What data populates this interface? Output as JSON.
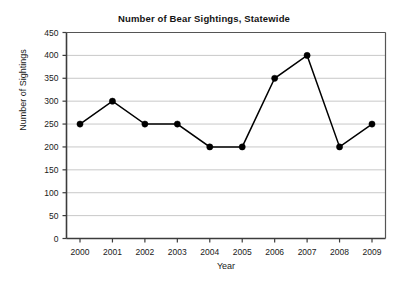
{
  "chart_data": {
    "type": "line",
    "title": "Number of Bear Sightings, Statewide",
    "xlabel": "Year",
    "ylabel": "Number of Sightings",
    "categories": [
      "2000",
      "2001",
      "2002",
      "2003",
      "2004",
      "2005",
      "2006",
      "2007",
      "2008",
      "2009"
    ],
    "values": [
      250,
      300,
      250,
      250,
      200,
      200,
      350,
      400,
      200,
      250
    ],
    "series": [
      {
        "name": "Bear Sightings",
        "values": [
          250,
          300,
          250,
          250,
          200,
          200,
          350,
          400,
          200,
          250
        ]
      }
    ],
    "ylim": [
      0,
      450
    ],
    "ytick_step": 50,
    "yticks": [
      0,
      50,
      100,
      150,
      200,
      250,
      300,
      350,
      400,
      450
    ],
    "ytick_labels": [
      "0",
      "50",
      "100",
      "150",
      "200",
      "250",
      "300",
      "350",
      "400",
      "450"
    ],
    "xtick_labels": [
      "2000",
      "2001",
      "2002",
      "2003",
      "2004",
      "2005",
      "2006",
      "2007",
      "2008",
      "2009"
    ],
    "grid": "horizontal",
    "legend": "none",
    "marker": "filled-circle",
    "line_color": "#000000",
    "marker_color": "#000000",
    "grid_color": "#c8c8c8",
    "axis_color": "#3c3c3c",
    "background_color": "#ffffff"
  },
  "figure": {
    "title": "Number of Bear Sightings, Statewide",
    "x_axis_title": "Year",
    "y_axis_title": "Number of Sightings"
  }
}
